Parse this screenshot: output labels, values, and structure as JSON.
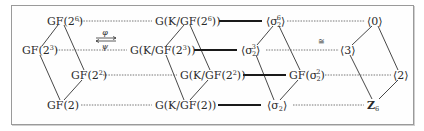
{
  "diagram": {
    "maps": {
      "forward": "φ",
      "backward": "ψ"
    },
    "isomorphism_symbol": "≅",
    "field_lattice": {
      "top": {
        "base": "GF(2",
        "exp": "6",
        "close": ")"
      },
      "left": {
        "base": "GF(2",
        "exp": "3",
        "close": ")"
      },
      "right": {
        "base": "GF(2",
        "exp": "2",
        "close": ")"
      },
      "bottom": {
        "base": "GF(2)",
        "exp": "",
        "close": ""
      }
    },
    "galois_group_lattice": {
      "top": {
        "base": "G(K/GF(2",
        "exp": "6",
        "close": "))"
      },
      "left": {
        "base": "G(K/GF(2",
        "exp": "3",
        "close": "))"
      },
      "right": {
        "base": "G(K/GF(2",
        "exp": "2",
        "close": "))"
      },
      "bottom": {
        "base": "G(K/GF(2))",
        "exp": "",
        "close": ""
      }
    },
    "frobenius_lattice": {
      "top": {
        "open": "⟨σ",
        "sub": "2",
        "sup": "6",
        "close": "⟩"
      },
      "left": {
        "open": "⟨σ",
        "sub": "2",
        "sup": "3",
        "close": "⟩"
      },
      "right": {
        "open": "GF(σ",
        "sub": "2",
        "sup": "2",
        "close": ")"
      },
      "bottom": {
        "open": "⟨σ",
        "sub": "2",
        "sup": "",
        "close": "⟩"
      }
    },
    "cyclic_lattice": {
      "top": "⟨0⟩",
      "left": "⟨3⟩",
      "right": "⟨2⟩",
      "bottom": {
        "base": "Z",
        "sub": "6"
      }
    }
  }
}
